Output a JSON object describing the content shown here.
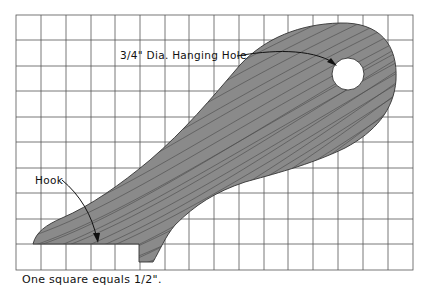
{
  "diagram": {
    "type": "woodworking-pattern",
    "grid": {
      "columns": 16,
      "rows": 10,
      "left": 16,
      "top": 15,
      "cell_w": 24.8,
      "cell_h": 25.5,
      "line_color": "#444444"
    },
    "shape_fill": "#8a8a8a",
    "grain_color": "#4a4a4a",
    "hole_fill": "#ffffff"
  },
  "labels": {
    "hole": "3/4\" Dia. Hanging Hole",
    "hook": "Hook"
  },
  "caption": "One square equals 1/2\"."
}
